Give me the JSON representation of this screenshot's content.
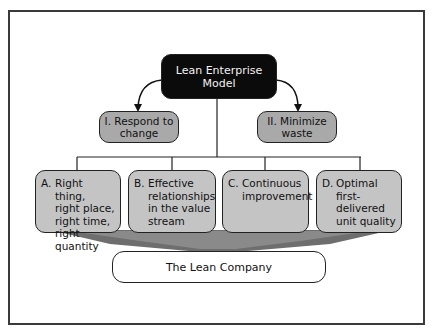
{
  "diagram": {
    "root": {
      "label_line1": "Lean Enterprise",
      "label_line2": "Model"
    },
    "principles": [
      {
        "label_line1": "I. Respond to",
        "label_line2": "change"
      },
      {
        "label_line1": "II. Minimize",
        "label_line2": "waste"
      }
    ],
    "elements": [
      {
        "tag": "A.",
        "text": "Right thing,\nright place,\nright time,\nright quantity"
      },
      {
        "tag": "B.",
        "text": "Effective\nrelationships\nin the value\nstream"
      },
      {
        "tag": "C.",
        "text": "Continuous\nimprovement"
      },
      {
        "tag": "D.",
        "text": "Optimal\nfirst-\ndelivered\nunit quality"
      }
    ],
    "result": {
      "label": "The Lean Company"
    },
    "colors": {
      "root_fill": "#0b0b0b",
      "principle_fill": "#a9a9a9",
      "element_fill": "#c4c4c4",
      "funnel_fill": "#6e6e6e",
      "result_fill": "#ffffff"
    }
  }
}
